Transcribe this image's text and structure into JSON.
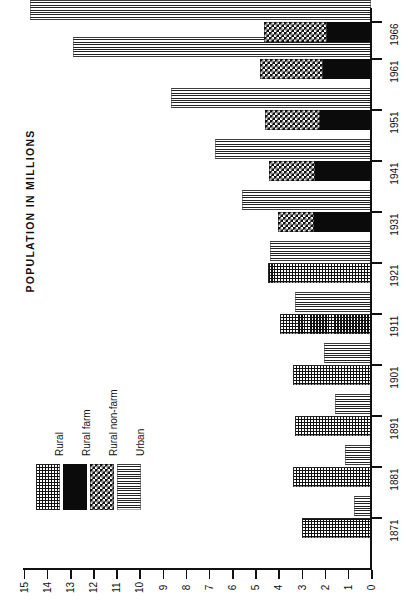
{
  "chart_data": {
    "type": "bar",
    "orientation": "horizontal",
    "title": "POPULATION IN MILLIONS",
    "xlabel": "",
    "ylabel": "POPULATION IN MILLIONS",
    "categories": [
      "1871",
      "1881",
      "1891",
      "1901",
      "1911",
      "1921",
      "1931",
      "1941",
      "1951",
      "1961",
      "1966"
    ],
    "value_axis_ticks": [
      "0",
      "1",
      "2",
      "3",
      "4",
      "5",
      "6",
      "7",
      "8",
      "9",
      "10",
      "11",
      "12",
      "13",
      "14",
      "15"
    ],
    "value_axis_range": [
      0,
      15
    ],
    "grid": false,
    "legend_position": "inside-left",
    "series": [
      {
        "name": "Rural",
        "pattern": "fine-grid",
        "values": [
          2.97,
          3.35,
          3.3,
          3.36,
          3.93,
          4.44,
          null,
          null,
          null,
          null,
          null
        ]
      },
      {
        "name": "Rural farm",
        "pattern": "solid-black",
        "values": [
          null,
          null,
          null,
          null,
          null,
          null,
          2.48,
          2.42,
          2.2,
          2.07,
          1.91
        ]
      },
      {
        "name": "Rural non-farm",
        "pattern": "checkerboard",
        "values": [
          null,
          null,
          null,
          null,
          null,
          null,
          1.54,
          1.99,
          2.38,
          2.71,
          2.73
        ]
      },
      {
        "name": "Urban",
        "pattern": "horizontal-lines",
        "values": [
          0.72,
          1.11,
          1.54,
          2.01,
          3.27,
          4.35,
          5.57,
          6.75,
          8.63,
          12.85,
          14.73
        ]
      }
    ]
  },
  "legend": {
    "items": [
      {
        "label": "Rural",
        "pattern": "fine-grid"
      },
      {
        "label": "Rural farm",
        "pattern": "solid-black"
      },
      {
        "label": "Rural non-farm",
        "pattern": "checkerboard"
      },
      {
        "label": "Urban",
        "pattern": "horizontal-lines"
      }
    ]
  }
}
